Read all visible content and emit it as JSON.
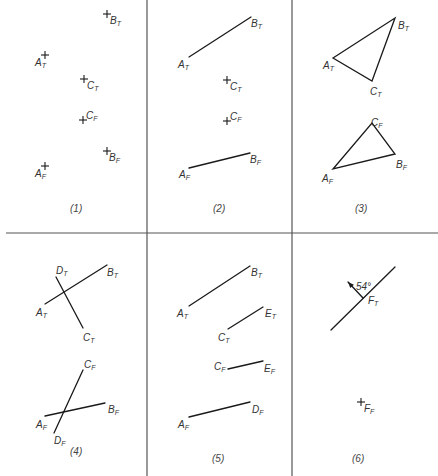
{
  "grid": {
    "vertical_x": [
      147,
      292
    ],
    "horizontal_y": 233,
    "top_col3_line_end": 233
  },
  "panels": [
    {
      "caption": "(1)",
      "caption_pos": [
        70,
        212
      ],
      "points": [
        {
          "name": "A",
          "sub": "T",
          "x": 45,
          "y": 55,
          "lx": 35,
          "ly": 66
        },
        {
          "name": "B",
          "sub": "T",
          "x": 107,
          "y": 14,
          "lx": 110,
          "ly": 24
        },
        {
          "name": "C",
          "sub": "T",
          "x": 84,
          "y": 79,
          "lx": 87,
          "ly": 89
        },
        {
          "name": "C",
          "sub": "F",
          "x": 83,
          "y": 120,
          "lx": 86,
          "ly": 119
        },
        {
          "name": "B",
          "sub": "F",
          "x": 107,
          "y": 151,
          "lx": 109,
          "ly": 161
        },
        {
          "name": "A",
          "sub": "F",
          "x": 45,
          "y": 166,
          "lx": 35,
          "ly": 177
        }
      ],
      "segments": []
    },
    {
      "caption": "(2)",
      "caption_pos": [
        213,
        212
      ],
      "points": [
        {
          "name": "C",
          "sub": "T",
          "x": 227,
          "y": 80,
          "lx": 230,
          "ly": 90,
          "cross": true
        },
        {
          "name": "C",
          "sub": "F",
          "x": 227,
          "y": 121,
          "lx": 230,
          "ly": 120,
          "cross": true
        }
      ],
      "labels": [
        {
          "name": "A",
          "sub": "T",
          "lx": 178,
          "ly": 68
        },
        {
          "name": "B",
          "sub": "T",
          "lx": 251,
          "ly": 27
        },
        {
          "name": "A",
          "sub": "F",
          "lx": 179,
          "ly": 178
        },
        {
          "name": "B",
          "sub": "F",
          "lx": 250,
          "ly": 163
        }
      ],
      "segments": [
        {
          "x1": 189,
          "y1": 57,
          "x2": 251,
          "y2": 17
        },
        {
          "x1": 189,
          "y1": 168,
          "x2": 250,
          "y2": 153
        }
      ]
    },
    {
      "caption": "(3)",
      "caption_pos": [
        355,
        212
      ],
      "labels": [
        {
          "name": "A",
          "sub": "T",
          "lx": 323,
          "ly": 69
        },
        {
          "name": "B",
          "sub": "T",
          "lx": 398,
          "ly": 29
        },
        {
          "name": "C",
          "sub": "T",
          "lx": 370,
          "ly": 95
        },
        {
          "name": "C",
          "sub": "F",
          "lx": 371,
          "ly": 126
        },
        {
          "name": "B",
          "sub": "F",
          "lx": 396,
          "ly": 168
        },
        {
          "name": "A",
          "sub": "F",
          "lx": 322,
          "ly": 182
        }
      ],
      "polygons": [
        {
          "points": "333,58 395,18 372,81"
        },
        {
          "points": "333,169 372,123 395,154"
        }
      ]
    },
    {
      "caption": "(4)",
      "caption_pos": [
        70,
        455
      ],
      "labels": [
        {
          "name": "D",
          "sub": "T",
          "lx": 56,
          "ly": 274
        },
        {
          "name": "B",
          "sub": "T",
          "lx": 107,
          "ly": 276
        },
        {
          "name": "A",
          "sub": "T",
          "lx": 36,
          "ly": 316
        },
        {
          "name": "C",
          "sub": "T",
          "lx": 83,
          "ly": 341
        },
        {
          "name": "C",
          "sub": "F",
          "lx": 84,
          "ly": 368
        },
        {
          "name": "B",
          "sub": "F",
          "lx": 108,
          "ly": 413
        },
        {
          "name": "A",
          "sub": "F",
          "lx": 36,
          "ly": 428
        },
        {
          "name": "D",
          "sub": "F",
          "lx": 54,
          "ly": 444
        }
      ],
      "segments": [
        {
          "x1": 45,
          "y1": 304,
          "x2": 107,
          "y2": 265
        },
        {
          "x1": 56,
          "y1": 277,
          "x2": 83,
          "y2": 328
        },
        {
          "x1": 45,
          "y1": 416,
          "x2": 105,
          "y2": 403
        },
        {
          "x1": 83,
          "y1": 370,
          "x2": 54,
          "y2": 433
        }
      ]
    },
    {
      "caption": "(5)",
      "caption_pos": [
        212,
        462
      ],
      "labels": [
        {
          "name": "B",
          "sub": "T",
          "lx": 251,
          "ly": 276
        },
        {
          "name": "A",
          "sub": "T",
          "lx": 177,
          "ly": 317
        },
        {
          "name": "E",
          "sub": "T",
          "lx": 265,
          "ly": 317
        },
        {
          "name": "C",
          "sub": "T",
          "lx": 218,
          "ly": 341
        },
        {
          "name": "C",
          "sub": "F",
          "lx": 214,
          "ly": 370
        },
        {
          "name": "E",
          "sub": "F",
          "lx": 264,
          "ly": 372
        },
        {
          "name": "D",
          "sub": "F",
          "lx": 252,
          "ly": 413
        },
        {
          "name": "A",
          "sub": "F",
          "lx": 178,
          "ly": 428
        }
      ],
      "segments": [
        {
          "x1": 189,
          "y1": 306,
          "x2": 250,
          "y2": 266
        },
        {
          "x1": 228,
          "y1": 329,
          "x2": 263,
          "y2": 307
        },
        {
          "x1": 228,
          "y1": 369,
          "x2": 263,
          "y2": 361
        },
        {
          "x1": 189,
          "y1": 417,
          "x2": 250,
          "y2": 402
        }
      ]
    },
    {
      "caption": "(6)",
      "caption_pos": [
        352,
        462
      ],
      "labels": [
        {
          "name": "F",
          "sub": "T",
          "lx": 368,
          "ly": 304
        },
        {
          "name": "F",
          "sub": "F",
          "lx": 364,
          "ly": 412
        }
      ],
      "points": [
        {
          "name": "F",
          "sub": "F",
          "x": 361,
          "y": 402,
          "cross": true
        }
      ],
      "segments": [
        {
          "x1": 331,
          "y1": 330,
          "x2": 395,
          "y2": 267
        }
      ],
      "arrow": {
        "x1": 363,
        "y1": 298,
        "x2": 348,
        "y2": 282
      },
      "angle_label": {
        "text": "54°",
        "x": 356,
        "y": 290
      }
    }
  ]
}
